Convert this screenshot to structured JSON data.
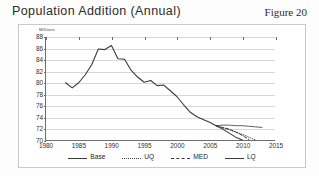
{
  "header": {
    "title": "Population Addition (Annual)",
    "figure_label": "Figure 20"
  },
  "chart_data": {
    "type": "line",
    "title": "Population Addition (Annual)",
    "xlabel": "",
    "ylabel": "Millions",
    "unit_label": "Millions",
    "xlim": [
      1980,
      2015
    ],
    "ylim": [
      70,
      88
    ],
    "xticks": [
      1980,
      1985,
      1990,
      1995,
      2000,
      2005,
      2010,
      2015
    ],
    "yticks": [
      70,
      72,
      74,
      76,
      78,
      80,
      82,
      84,
      86,
      88
    ],
    "grid": "horizontal",
    "legend_position": "bottom",
    "series": [
      {
        "name": "Base",
        "style": "solid",
        "x": [
          1983,
          1984,
          1985,
          1986,
          1987,
          1988,
          1989,
          1990,
          1991,
          1992,
          1993,
          1994,
          1995,
          1996,
          1997,
          1998,
          1999,
          2000,
          2001,
          2002,
          2003,
          2004,
          2005,
          2006,
          2007,
          2008,
          2009,
          2010
        ],
        "values": [
          80.0,
          79.1,
          80.0,
          81.4,
          83.2,
          85.9,
          85.8,
          86.5,
          84.2,
          84.1,
          82.2,
          81.0,
          80.1,
          80.4,
          79.5,
          79.6,
          78.6,
          77.6,
          76.2,
          74.9,
          74.1,
          73.6,
          73.1,
          72.5,
          71.9,
          71.2,
          70.5,
          70.0
        ]
      },
      {
        "name": "UQ",
        "style": "dotted",
        "x": [
          2006,
          2007,
          2008,
          2009,
          2010,
          2011,
          2012
        ],
        "values": [
          72.5,
          72.1,
          71.8,
          71.4,
          71.0,
          70.5,
          70.0
        ]
      },
      {
        "name": "MED",
        "style": "dashed",
        "x": [
          2006,
          2007,
          2008,
          2009,
          2010,
          2011
        ],
        "values": [
          72.5,
          72.2,
          71.9,
          71.4,
          70.8,
          70.1
        ]
      },
      {
        "name": "LQ",
        "style": "solid-thin",
        "x": [
          2006,
          2007,
          2008,
          2009,
          2010,
          2011,
          2012,
          2013
        ],
        "values": [
          72.5,
          72.6,
          72.6,
          72.5,
          72.5,
          72.4,
          72.3,
          72.2
        ]
      }
    ],
    "legend": [
      {
        "label": "Base",
        "style": "solid"
      },
      {
        "label": "UQ",
        "style": "dotted"
      },
      {
        "label": "MED",
        "style": "dashed"
      },
      {
        "label": "LQ",
        "style": "solid-thin"
      }
    ],
    "colors": {
      "line": "#3a3a3a",
      "grid": "#d8d8d8",
      "axis": "#6e6e6e"
    }
  }
}
